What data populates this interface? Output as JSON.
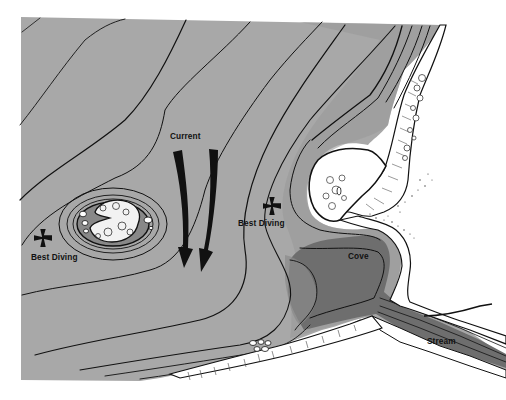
{
  "map": {
    "type": "diving-site-bathymetric-sketch",
    "colors": {
      "water": "#a8a8a8",
      "deep_water": "#7c7c7c",
      "cove_water": "#6e6e6e",
      "land": "#ffffff",
      "contour": "#111111",
      "marker": "#111111"
    },
    "labels": {
      "current": "Current",
      "best_diving_left": "Best Diving",
      "best_diving_right": "Best Diving",
      "cove": "Cove",
      "stream": "Stream"
    },
    "features": [
      {
        "name": "current-arrows",
        "count": 2,
        "direction": "south"
      },
      {
        "name": "offshore-islet",
        "type": "rocky-islet"
      },
      {
        "name": "dive-marker-left",
        "icon": "cross-pattee"
      },
      {
        "name": "dive-marker-right",
        "icon": "cross-pattee"
      },
      {
        "name": "cove"
      },
      {
        "name": "stream"
      },
      {
        "name": "rocky-shoreline"
      }
    ]
  }
}
